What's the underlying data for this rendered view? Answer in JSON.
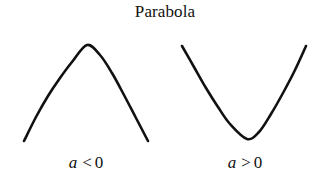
{
  "figure": {
    "title": "Parabola",
    "background_color": "#ffffff",
    "stroke_color": "#111111",
    "stroke_width": 2.6,
    "width": 330,
    "height": 189
  },
  "panels": [
    {
      "id": "left",
      "caption_variable": "a",
      "caption_relation": "<",
      "caption_value": "0",
      "caption_text": "a < 0",
      "opening": "down",
      "description": "downward-opening parabola"
    },
    {
      "id": "right",
      "caption_variable": "a",
      "caption_relation": ">",
      "caption_value": "0",
      "caption_text": "a > 0",
      "opening": "up",
      "description": "upward-opening parabola"
    }
  ],
  "chart_data": {
    "type": "line",
    "title": "Parabola",
    "xlabel": "",
    "ylabel": "",
    "grid": false,
    "axes_visible": false,
    "legend": "none",
    "note": "Two schematic parabola curves illustrating the sign of the leading coefficient a. Coordinates are in image pixel space, y increasing downward.",
    "series": [
      {
        "name": "a < 0",
        "opening": "down",
        "vertex": [
          87,
          45
        ],
        "endpoints": [
          [
            24,
            141
          ],
          [
            148,
            141
          ]
        ],
        "x": [
          24,
          36,
          48,
          60,
          72,
          87,
          100,
          112,
          124,
          136,
          148
        ],
        "y": [
          141,
          117,
          96,
          78,
          62,
          45,
          55,
          73,
          95,
          118,
          141
        ]
      },
      {
        "name": "a > 0",
        "opening": "up",
        "vertex": [
          247,
          139
        ],
        "endpoints": [
          [
            182,
            46
          ],
          [
            306,
            46
          ]
        ],
        "x": [
          182,
          194,
          206,
          218,
          230,
          247,
          259,
          271,
          283,
          295,
          306
        ],
        "y": [
          46,
          67,
          88,
          107,
          124,
          139,
          132,
          114,
          93,
          70,
          46
        ]
      }
    ]
  }
}
